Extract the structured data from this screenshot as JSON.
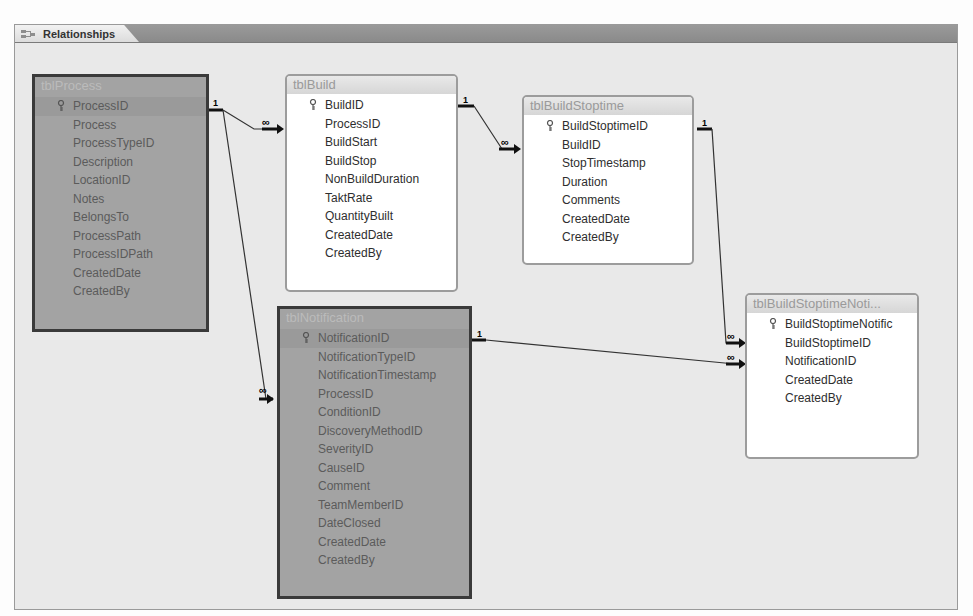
{
  "window": {
    "tab_label": "Relationships",
    "tab_icon": "relationships-icon"
  },
  "tables": {
    "tblProcess": {
      "title": "tblProcess",
      "selected": true,
      "fields": [
        "ProcessID",
        "Process",
        "ProcessTypeID",
        "Description",
        "LocationID",
        "Notes",
        "BelongsTo",
        "ProcessPath",
        "ProcessIDPath",
        "CreatedDate",
        "CreatedBy"
      ],
      "primary_key": "ProcessID"
    },
    "tblBuild": {
      "title": "tblBuild",
      "selected": false,
      "fields": [
        "BuildID",
        "ProcessID",
        "BuildStart",
        "BuildStop",
        "NonBuildDuration",
        "TaktRate",
        "QuantityBuilt",
        "CreatedDate",
        "CreatedBy"
      ],
      "primary_key": "BuildID"
    },
    "tblBuildStoptime": {
      "title": "tblBuildStoptime",
      "selected": false,
      "fields": [
        "BuildStoptimeID",
        "BuildID",
        "StopTimestamp",
        "Duration",
        "Comments",
        "CreatedDate",
        "CreatedBy"
      ],
      "primary_key": "BuildStoptimeID"
    },
    "tblBuildStoptimeNotification": {
      "title": "tblBuildStoptimeNoti...",
      "selected": false,
      "fields": [
        "BuildStoptimeNotific",
        "BuildStoptimeID",
        "NotificationID",
        "CreatedDate",
        "CreatedBy"
      ],
      "primary_key": "BuildStoptimeNotific"
    },
    "tblNotification": {
      "title": "tblNotification",
      "selected": true,
      "fields": [
        "NotificationID",
        "NotificationTypeID",
        "NotificationTimestamp",
        "ProcessID",
        "ConditionID",
        "DiscoveryMethodID",
        "SeverityID",
        "CauseID",
        "Comment",
        "TeamMemberID",
        "DateClosed",
        "CreatedDate",
        "CreatedBy"
      ],
      "primary_key": "NotificationID"
    }
  },
  "relationships": [
    {
      "from": "tblProcess.ProcessID",
      "to": "tblBuild.ProcessID",
      "one": "1",
      "many": "∞"
    },
    {
      "from": "tblProcess.ProcessID",
      "to": "tblNotification.ProcessID",
      "one": "1",
      "many": "∞"
    },
    {
      "from": "tblBuild.BuildID",
      "to": "tblBuildStoptime.BuildID",
      "one": "1",
      "many": "∞"
    },
    {
      "from": "tblBuildStoptime.BuildStoptimeID",
      "to": "tblBuildStoptimeNotification.BuildStoptimeID",
      "one": "1",
      "many": "∞"
    },
    {
      "from": "tblNotification.NotificationID",
      "to": "tblBuildStoptimeNotification.NotificationID",
      "one": "1",
      "many": "∞"
    }
  ],
  "labels": {
    "one": "1",
    "many": "∞"
  }
}
